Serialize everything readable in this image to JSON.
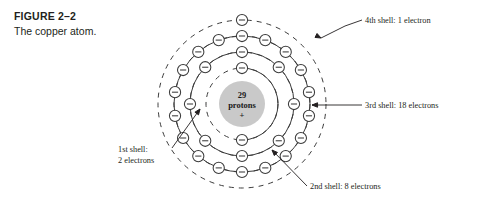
{
  "figure": {
    "number": "FIGURE 2–2",
    "title": "The copper atom."
  },
  "nucleus": {
    "count_label": "29",
    "particle_label": "protons",
    "charge_label": "+",
    "fill_color": "#c9c9c9",
    "radius": 23
  },
  "diagram": {
    "center_x": 242,
    "center_y": 104,
    "ring_stroke_color": "#3b3b3b",
    "electron_radius": 5.6,
    "electron_symbol": "minus"
  },
  "shells": [
    {
      "name": "1st shell",
      "index": 1,
      "radius": 36,
      "electron_count": 2,
      "angles": [
        -90,
        90
      ],
      "label": "1st shell:\n2 electrons"
    },
    {
      "name": "2nd shell",
      "index": 2,
      "radius": 52,
      "electron_count": 8,
      "angles": [
        -90,
        -45,
        0,
        45,
        90,
        135,
        180,
        225
      ],
      "label": "2nd shell: 8 electrons"
    },
    {
      "name": "3rd shell",
      "index": 3,
      "radius": 68,
      "electron_count": 18,
      "angles": [
        -90,
        -70,
        -50,
        -30,
        -10,
        10,
        30,
        50,
        70,
        90,
        110,
        130,
        150,
        170,
        190,
        210,
        230,
        250
      ],
      "label": "3rd shell: 18 electrons"
    },
    {
      "name": "4th shell",
      "index": 4,
      "radius": 84,
      "electron_count": 1,
      "angles": [
        -90
      ],
      "label": "4th shell: 1 electron"
    }
  ],
  "callouts": [
    {
      "id": "shell-4-callout",
      "text": "4th shell: 1 electron",
      "text_x": 365,
      "text_y": 23,
      "anchor": "start",
      "leader": "M 362 20 L 345 26 L 321 38",
      "arrow": true,
      "arrow_x": 321,
      "arrow_y": 38,
      "arrow_angle": 27
    },
    {
      "id": "shell-3-callout",
      "text": "3rd shell: 18 electrons",
      "text_x": 365,
      "text_y": 108,
      "anchor": "start",
      "leader": "M 362 105 L 312 105",
      "arrow": true,
      "arrow_x": 312,
      "arrow_y": 105,
      "arrow_angle": 180
    },
    {
      "id": "shell-1-callout",
      "text_lines": [
        "1st shell:",
        "2 electrons"
      ],
      "text_x": 118,
      "text_y": 152,
      "anchor": "start",
      "leader": "M 172 148 L 200 109",
      "arrow": true,
      "arrow_x": 200,
      "arrow_y": 109,
      "arrow_angle": -54
    },
    {
      "id": "shell-2-callout",
      "text": "2nd shell: 8 electrons",
      "text_x": 310,
      "text_y": 189,
      "anchor": "start",
      "leader": "M 307 186 L 272 150",
      "arrow": true,
      "arrow_x": 272,
      "arrow_y": 150,
      "arrow_angle": -134
    }
  ]
}
